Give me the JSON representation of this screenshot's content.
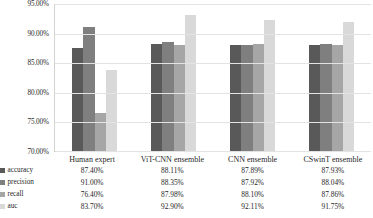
{
  "chart_data": {
    "type": "bar",
    "title": "",
    "xlabel": "",
    "ylabel": "",
    "ylim": [
      0.7,
      0.95
    ],
    "grid": true,
    "legend_position": "table-left",
    "y_tick_labels": [
      "95.00%",
      "90.00%",
      "85.00%",
      "80.00%",
      "75.00%",
      "70.00%"
    ],
    "y_tick_values": [
      0.95,
      0.9,
      0.85,
      0.8,
      0.75,
      0.7
    ],
    "categories": [
      "Human expert",
      "ViT-CNN ensemble",
      "CNN ensemble",
      "CSwinT ensemble"
    ],
    "series": [
      {
        "name": "accuracy",
        "color": "#595959",
        "values": [
          0.874,
          0.8811,
          0.8789,
          0.8793
        ],
        "labels": [
          "87.40%",
          "88.11%",
          "87.89%",
          "87.93%"
        ]
      },
      {
        "name": "precision",
        "color": "#7f7f7f",
        "values": [
          0.91,
          0.8835,
          0.8792,
          0.8804
        ],
        "labels": [
          "91.00%",
          "88.35%",
          "87.92%",
          "88.04%"
        ]
      },
      {
        "name": "recall",
        "color": "#a6a6a6",
        "values": [
          0.764,
          0.8798,
          0.881,
          0.8786
        ],
        "labels": [
          "76.40%",
          "87.98%",
          "88.10%",
          "87.86%"
        ]
      },
      {
        "name": "auc",
        "color": "#d9d9d9",
        "values": [
          0.837,
          0.929,
          0.9211,
          0.9175
        ],
        "labels": [
          "83.70%",
          "92.90%",
          "92.11%",
          "91.75%"
        ]
      }
    ]
  },
  "table": {
    "corner_label": "",
    "column_headers": [
      "Human expert",
      "ViT-CNN ensemble",
      "CNN ensemble",
      "CSwinT ensemble"
    ],
    "rows": [
      {
        "label": "accuracy",
        "values": [
          "87.40%",
          "88.11%",
          "87.89%",
          "87.93%"
        ]
      },
      {
        "label": "precision",
        "values": [
          "91.00%",
          "88.35%",
          "87.92%",
          "88.04%"
        ]
      },
      {
        "label": "recall",
        "values": [
          "76.40%",
          "87.98%",
          "88.10%",
          "87.86%"
        ]
      },
      {
        "label": "auc",
        "values": [
          "83.70%",
          "92.90%",
          "92.11%",
          "91.75%"
        ]
      }
    ]
  }
}
